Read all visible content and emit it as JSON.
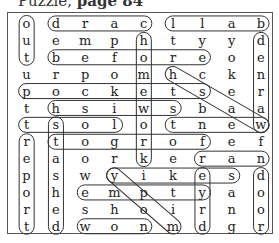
{
  "title": {
    "prefix": "Puzzle,",
    "page": "page 84"
  },
  "grid": [
    [
      "o",
      "d",
      "r",
      "a",
      "c",
      "l",
      "l",
      "a",
      "b"
    ],
    [
      "u",
      "e",
      "m",
      "p",
      "h",
      "t",
      "y",
      "y",
      "d"
    ],
    [
      "t",
      "b",
      "e",
      "f",
      "o",
      "r",
      "e",
      "o",
      "e"
    ],
    [
      "u",
      "r",
      "p",
      "o",
      "m",
      "h",
      "c",
      "k",
      "n"
    ],
    [
      "p",
      "o",
      "c",
      "k",
      "e",
      "t",
      "s",
      "e",
      "r"
    ],
    [
      "t",
      "h",
      "s",
      "i",
      "w",
      "s",
      "b",
      "a",
      "a"
    ],
    [
      "t",
      "s",
      "o",
      "l",
      "o",
      "t",
      "n",
      "e",
      "w"
    ],
    [
      "r",
      "t",
      "o",
      "g",
      "r",
      "o",
      "f",
      "e",
      "f"
    ],
    [
      "e",
      "a",
      "o",
      "r",
      "k",
      "e",
      "r",
      "a",
      "n"
    ],
    [
      "p",
      "s",
      "w",
      "y",
      "i",
      "k",
      "e",
      "s",
      "d"
    ],
    [
      "o",
      "h",
      "e",
      "m",
      "p",
      "t",
      "y",
      "a",
      "o"
    ],
    [
      "r",
      "e",
      "s",
      "h",
      "o",
      "i",
      "r",
      "n",
      "o"
    ],
    [
      "t",
      "d",
      "w",
      "o",
      "n",
      "m",
      "d",
      "g",
      "r"
    ]
  ],
  "found_words": [
    "out",
    "card",
    "ball",
    "before",
    "pocket",
    "this",
    "lost",
    "toger",
    "ran",
    "yikes",
    "empty",
    "wonm",
    "report",
    "shed",
    "hoy",
    "hewn",
    "denraw",
    "door",
    "dry",
    "his"
  ]
}
